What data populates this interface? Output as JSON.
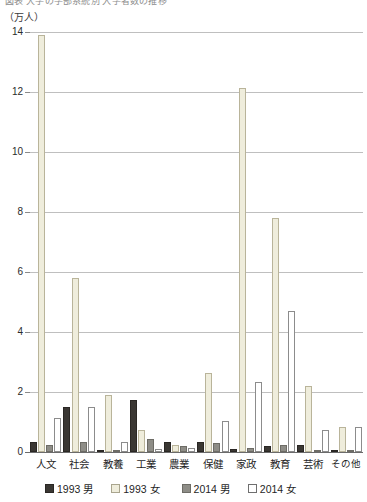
{
  "title": {
    "text": "図表 大学の学部系統別 入学者数の推移"
  },
  "unit_label": "（万人）",
  "chart_data": {
    "type": "bar",
    "title": "図表 大学の学部系統別 入学者数の推移",
    "xlabel": "",
    "ylabel": "（万人）",
    "ylim": [
      0,
      14
    ],
    "yticks": [
      0,
      2,
      4,
      6,
      8,
      10,
      12,
      14
    ],
    "ytick_labels": [
      "0",
      "2",
      "4",
      "6",
      "8",
      "10",
      "12",
      "14"
    ],
    "grid": true,
    "legend_position": "bottom",
    "categories": [
      "人文",
      "社会",
      "教養",
      "工業",
      "農業",
      "保健",
      "家政",
      "教育",
      "芸術",
      "その他"
    ],
    "series": [
      {
        "name": "1993 男",
        "color": "#3a3733",
        "values": [
          0.35,
          1.5,
          0.05,
          1.75,
          0.35,
          0.35,
          0.1,
          0.2,
          0.25,
          0.05
        ]
      },
      {
        "name": "1993 女",
        "color": "#efeddc",
        "values": [
          13.9,
          5.8,
          1.9,
          0.75,
          0.25,
          2.65,
          12.15,
          7.8,
          2.2,
          0.85
        ]
      },
      {
        "name": "2014 男",
        "color": "#8e8d87",
        "values": [
          0.25,
          0.35,
          0.05,
          0.45,
          0.2,
          0.3,
          0.15,
          0.25,
          0.05,
          0.08
        ]
      },
      {
        "name": "2014 女",
        "color": "#ffffff",
        "values": [
          1.15,
          1.5,
          0.35,
          0.1,
          0.12,
          1.05,
          2.35,
          4.7,
          0.75,
          0.85
        ]
      }
    ]
  }
}
